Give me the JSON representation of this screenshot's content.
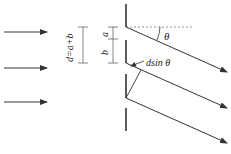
{
  "diagram": {
    "labels": {
      "period": "d=a+b",
      "slit_width": "a",
      "opaque_width": "b",
      "angle": "θ",
      "path_difference": "dsin θ"
    },
    "incident_rays": 3,
    "diffracted_rays": 3,
    "colors": {
      "line": "#333333",
      "dashed": "#777777",
      "dim": "#666666"
    }
  }
}
